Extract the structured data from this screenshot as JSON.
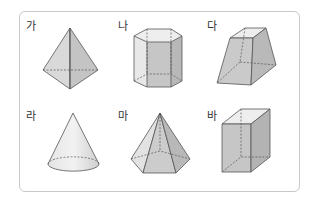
{
  "figure": {
    "colors": {
      "border": "#c8c8c8",
      "fill_light": "#e6e6e6",
      "fill_mid": "#cfcfcf",
      "fill_dark": "#b3b3b3",
      "edge": "#555555"
    },
    "shapes": [
      {
        "label": "가",
        "shape": "triangular bipyramid"
      },
      {
        "label": "나",
        "shape": "octagonal prism"
      },
      {
        "label": "다",
        "shape": "square frustum"
      },
      {
        "label": "라",
        "shape": "cone"
      },
      {
        "label": "마",
        "shape": "hexagonal pyramid"
      },
      {
        "label": "바",
        "shape": "rectangular prism"
      }
    ]
  }
}
